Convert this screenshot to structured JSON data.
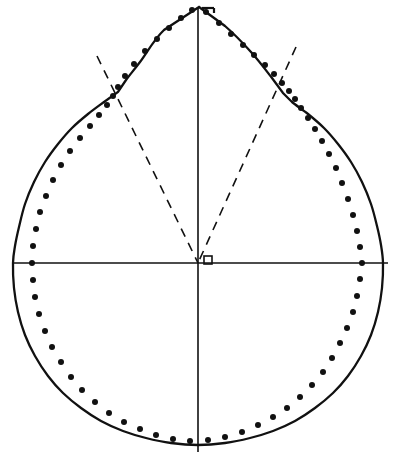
{
  "figure": {
    "background_color": "#ffffff",
    "ink_color": "#111111",
    "width": 409,
    "height": 459
  },
  "axes": {
    "origin": {
      "x": 198,
      "y": 263,
      "label": "o"
    },
    "origin_marker": {
      "name": "origin-square-marker",
      "shape": "square",
      "x": 204,
      "y": 256,
      "size": 8,
      "filled": false
    },
    "vertical": {
      "label": "vertical-axis",
      "x": 198,
      "y_top": 8,
      "y_bottom": 452,
      "stroke_width": 1.6
    },
    "horizontal": {
      "label": "horizontal-axis",
      "y": 263,
      "x_left": 12,
      "x_right": 388,
      "stroke_width": 1.6
    }
  },
  "apex": {
    "name": "apex-point",
    "x": 199,
    "y": 7,
    "tick_mark": {
      "name": "apex-tick-mark",
      "x1": 202,
      "y1": 8,
      "x2": 214,
      "y2": 8,
      "stub_x": 214,
      "stub_y1": 8,
      "stub_y2": 13
    }
  },
  "shoulders": {
    "left": {
      "x": 118,
      "y": 92
    },
    "right": {
      "x": 283,
      "y": 93
    }
  },
  "dashed_rays": [
    {
      "name": "left-dashed-ray",
      "x1": 97,
      "y1": 56,
      "x2": 198,
      "y2": 263,
      "dash": "9 7",
      "stroke_width": 1.6
    },
    {
      "name": "right-dashed-ray",
      "x1": 296,
      "y1": 47,
      "x2": 198,
      "y2": 263,
      "dash": "9 7",
      "stroke_width": 1.6
    }
  ],
  "chart_data": {
    "type": "line",
    "xlabel": "",
    "ylabel": "",
    "xlim": [
      0,
      409
    ],
    "ylim": [
      0,
      459
    ],
    "grid": false,
    "legend": "none",
    "annotations": [
      {
        "text": "o",
        "x": 204,
        "y": 256,
        "name": "origin-label"
      }
    ],
    "series": [
      {
        "name": "solid-profile-curve",
        "style": "solid",
        "closed": true,
        "stroke": "#111111",
        "stroke_width": 2.3,
        "points": [
          [
            199,
            7
          ],
          [
            164,
            30
          ],
          [
            140,
            62
          ],
          [
            126,
            80
          ],
          [
            118,
            92
          ],
          [
            104,
            102
          ],
          [
            88,
            114
          ],
          [
            72,
            128
          ],
          [
            58,
            144
          ],
          [
            45,
            162
          ],
          [
            34,
            182
          ],
          [
            25,
            204
          ],
          [
            19,
            227
          ],
          [
            15,
            246
          ],
          [
            13,
            263
          ],
          [
            14,
            288
          ],
          [
            18,
            312
          ],
          [
            25,
            335
          ],
          [
            35,
            356
          ],
          [
            48,
            376
          ],
          [
            63,
            393
          ],
          [
            81,
            408
          ],
          [
            101,
            421
          ],
          [
            123,
            431
          ],
          [
            146,
            438
          ],
          [
            171,
            443
          ],
          [
            198,
            445
          ],
          [
            225,
            443
          ],
          [
            250,
            438
          ],
          [
            273,
            431
          ],
          [
            295,
            421
          ],
          [
            315,
            408
          ],
          [
            333,
            393
          ],
          [
            348,
            376
          ],
          [
            361,
            356
          ],
          [
            371,
            335
          ],
          [
            378,
            312
          ],
          [
            382,
            288
          ],
          [
            383,
            263
          ],
          [
            381,
            245
          ],
          [
            377,
            226
          ],
          [
            371,
            204
          ],
          [
            362,
            182
          ],
          [
            351,
            162
          ],
          [
            338,
            144
          ],
          [
            324,
            128
          ],
          [
            308,
            114
          ],
          [
            292,
            102
          ],
          [
            283,
            93
          ],
          [
            272,
            78
          ],
          [
            251,
            52
          ],
          [
            225,
            26
          ],
          [
            199,
            7
          ]
        ]
      },
      {
        "name": "measured-data-points",
        "style": "dots",
        "marker": "round-dot",
        "fill": "#111111",
        "marker_size": 3.0,
        "points": [
          [
            206,
            12
          ],
          [
            219,
            23
          ],
          [
            231,
            34
          ],
          [
            243,
            45
          ],
          [
            254,
            55
          ],
          [
            265,
            65
          ],
          [
            274,
            74
          ],
          [
            282,
            83
          ],
          [
            289,
            91
          ],
          [
            295,
            99
          ],
          [
            301,
            108
          ],
          [
            308,
            118
          ],
          [
            315,
            129
          ],
          [
            322,
            141
          ],
          [
            329,
            154
          ],
          [
            336,
            168
          ],
          [
            342,
            183
          ],
          [
            348,
            199
          ],
          [
            353,
            215
          ],
          [
            357,
            231
          ],
          [
            360,
            247
          ],
          [
            362,
            263
          ],
          [
            360,
            279
          ],
          [
            357,
            296
          ],
          [
            353,
            312
          ],
          [
            347,
            328
          ],
          [
            340,
            343
          ],
          [
            332,
            358
          ],
          [
            323,
            372
          ],
          [
            312,
            385
          ],
          [
            300,
            397
          ],
          [
            287,
            408
          ],
          [
            273,
            417
          ],
          [
            258,
            425
          ],
          [
            242,
            432
          ],
          [
            225,
            437
          ],
          [
            208,
            440
          ],
          [
            190,
            441
          ],
          [
            173,
            439
          ],
          [
            156,
            435
          ],
          [
            140,
            429
          ],
          [
            124,
            422
          ],
          [
            109,
            413
          ],
          [
            95,
            402
          ],
          [
            82,
            390
          ],
          [
            71,
            377
          ],
          [
            61,
            362
          ],
          [
            52,
            347
          ],
          [
            45,
            331
          ],
          [
            39,
            314
          ],
          [
            35,
            297
          ],
          [
            33,
            280
          ],
          [
            32,
            263
          ],
          [
            33,
            246
          ],
          [
            36,
            229
          ],
          [
            40,
            212
          ],
          [
            46,
            196
          ],
          [
            53,
            180
          ],
          [
            61,
            165
          ],
          [
            70,
            151
          ],
          [
            80,
            138
          ],
          [
            90,
            126
          ],
          [
            99,
            115
          ],
          [
            107,
            105
          ],
          [
            113,
            96
          ],
          [
            118,
            87
          ],
          [
            125,
            76
          ],
          [
            134,
            64
          ],
          [
            145,
            51
          ],
          [
            157,
            39
          ],
          [
            169,
            28
          ],
          [
            181,
            18
          ],
          [
            192,
            10
          ]
        ]
      }
    ]
  }
}
